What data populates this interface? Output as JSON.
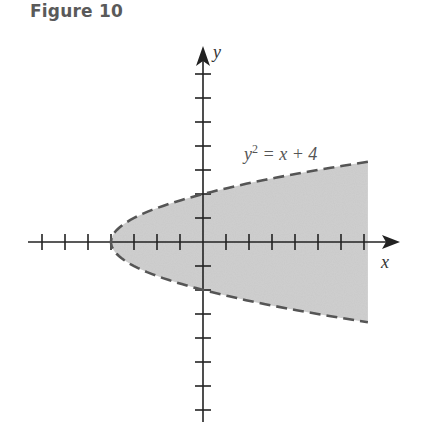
{
  "figure": {
    "title": "Figure 10"
  },
  "chart_data": {
    "type": "area",
    "title": "Figure 10",
    "subtitle": "",
    "xlabel": "x",
    "ylabel": "y",
    "equation_label": "y² = x + 4",
    "equation_parts": {
      "lhs_base": "y",
      "lhs_exp": "2",
      "rhs": " = x + 4"
    },
    "curve": {
      "equation": "y^2 = x + 4",
      "style": "dashed",
      "vertex": [
        -4,
        0
      ],
      "y_intercepts": [
        2,
        -2
      ]
    },
    "region": {
      "inequality": "y^2 < x + 4",
      "shaded": true,
      "fill": "#c8c8c8"
    },
    "x_ticks": [
      -7,
      -6,
      -5,
      -4,
      -3,
      -2,
      -1,
      1,
      2,
      3,
      4,
      5,
      6,
      7
    ],
    "y_ticks": [
      -7,
      -6,
      -5,
      -4,
      -3,
      -2,
      -1,
      1,
      2,
      3,
      4,
      5,
      6,
      7
    ],
    "xlim": [
      -7.5,
      8.5
    ],
    "ylim": [
      -7.6,
      8.1
    ],
    "grid": false,
    "legend": null,
    "tick_labels_shown": false,
    "colors": {
      "axis": "#222222",
      "curve": "#555555",
      "fill": "#c8c8c8"
    },
    "series": [
      {
        "name": "y^2 = x + 4 (boundary)",
        "points": [
          [
            -4,
            0
          ],
          [
            -3,
            1
          ],
          [
            -3,
            -1
          ],
          [
            0,
            2
          ],
          [
            0,
            -2
          ],
          [
            5,
            3
          ],
          [
            5,
            -3
          ],
          [
            7.17,
            3.34
          ],
          [
            7.17,
            -3.34
          ]
        ]
      }
    ]
  }
}
